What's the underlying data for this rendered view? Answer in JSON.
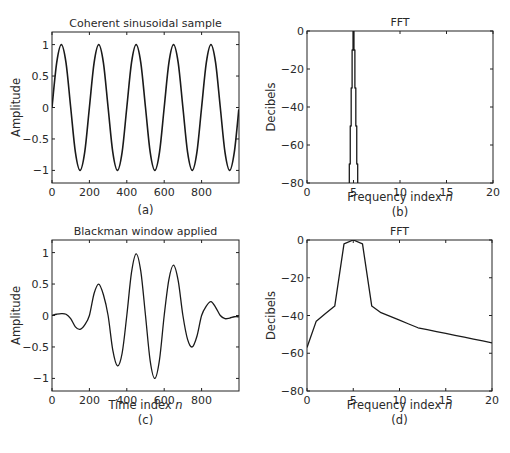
{
  "figure": {
    "panels": [
      {
        "id": "a",
        "title": "Coherent sinusoidal sample",
        "xlabel": "",
        "ylabel": "Amplitude",
        "caption": "(a)"
      },
      {
        "id": "b",
        "title": "FFT",
        "xlabel": "Frequency index n",
        "ylabel": "Decibels",
        "caption": "(b)"
      },
      {
        "id": "c",
        "title": "Blackman window applied",
        "xlabel": "Time index n",
        "ylabel": "Amplitude",
        "caption": "(c)"
      },
      {
        "id": "d",
        "title": "FFT",
        "xlabel": "Frequency index n",
        "ylabel": "Decibels",
        "caption": "(d)"
      }
    ]
  },
  "chart_data": [
    {
      "id": "a",
      "type": "line",
      "title": "Coherent sinusoidal sample",
      "xlabel": "",
      "ylabel": "Amplitude",
      "caption": "(a)",
      "xlim": [
        0,
        1000
      ],
      "ylim": [
        -1.2,
        1.2
      ],
      "xticks": [
        0,
        200,
        400,
        600,
        800
      ],
      "yticks": [
        1,
        0.5,
        0,
        -0.5,
        -1
      ],
      "ytick_labels": [
        "1",
        "0.5",
        "0",
        "−0.5",
        "−1"
      ],
      "grid": false,
      "description": "sin(2*pi*5*n/1000), 5 full cycles",
      "x": [
        0,
        25,
        50,
        75,
        100,
        125,
        150,
        175,
        200,
        225,
        250,
        275,
        300,
        325,
        350,
        375,
        400,
        425,
        450,
        475,
        500,
        525,
        550,
        575,
        600,
        625,
        650,
        675,
        700,
        725,
        750,
        775,
        800,
        825,
        850,
        875,
        900,
        925,
        950,
        975,
        999
      ],
      "values": [
        0,
        0.71,
        1,
        0.71,
        0,
        -0.71,
        -1,
        -0.71,
        0,
        0.71,
        1,
        0.71,
        0,
        -0.71,
        -1,
        -0.71,
        0,
        0.71,
        1,
        0.71,
        0,
        -0.71,
        -1,
        -0.71,
        0,
        0.71,
        1,
        0.71,
        0,
        -0.71,
        -1,
        -0.71,
        0,
        0.71,
        1,
        0.71,
        0,
        -0.71,
        -1,
        -0.71,
        -0.03
      ]
    },
    {
      "id": "b",
      "type": "line",
      "title": "FFT",
      "xlabel": "Frequency index n",
      "ylabel": "Decibels",
      "caption": "(b)",
      "xlim": [
        0,
        20
      ],
      "ylim": [
        -80,
        0
      ],
      "xticks": [
        0,
        5,
        10,
        15,
        20
      ],
      "yticks": [
        0,
        -20,
        -40,
        -60,
        -80
      ],
      "ytick_labels": [
        "0",
        "−20",
        "−40",
        "−60",
        "−80"
      ],
      "grid": false,
      "description": "Single spectral line at n=5 (0 dB); all other bins below -80 dB",
      "x": [
        4.55,
        4.55,
        4.65,
        4.65,
        4.75,
        4.75,
        4.85,
        4.85,
        4.95,
        4.95,
        5.05,
        5.05,
        5.15,
        5.15,
        5.25,
        5.25,
        5.35,
        5.35,
        5.45,
        5.45
      ],
      "values": [
        -80,
        -70,
        -70,
        -50,
        -50,
        -30,
        -30,
        -10,
        -10,
        0,
        0,
        -10,
        -10,
        -30,
        -30,
        -50,
        -50,
        -70,
        -70,
        -80
      ]
    },
    {
      "id": "c",
      "type": "line",
      "title": "Blackman window applied",
      "xlabel": "Time index n",
      "ylabel": "Amplitude",
      "caption": "(c)",
      "xlim": [
        0,
        1000
      ],
      "ylim": [
        -1.2,
        1.2
      ],
      "xticks": [
        0,
        200,
        400,
        600,
        800
      ],
      "yticks": [
        1,
        0.5,
        0,
        -0.5,
        -1
      ],
      "ytick_labels": [
        "1",
        "0.5",
        "0",
        "−0.5",
        "−1"
      ],
      "grid": false,
      "description": "Sinusoid multiplied by Blackman window",
      "x": [
        0,
        25,
        50,
        75,
        100,
        125,
        150,
        175,
        200,
        225,
        250,
        275,
        300,
        325,
        350,
        375,
        400,
        425,
        450,
        475,
        500,
        525,
        550,
        575,
        600,
        625,
        650,
        675,
        700,
        725,
        750,
        775,
        800,
        825,
        850,
        875,
        900,
        925,
        950,
        975,
        999
      ],
      "values": [
        0,
        0.02,
        0.03,
        0.02,
        -0.05,
        -0.18,
        -0.22,
        -0.15,
        0,
        0.35,
        0.5,
        0.33,
        0,
        -0.55,
        -0.8,
        -0.6,
        0,
        0.68,
        0.98,
        0.7,
        0,
        -0.72,
        -1.0,
        -0.7,
        0,
        0.57,
        0.8,
        0.55,
        0,
        -0.38,
        -0.5,
        -0.33,
        0,
        0.15,
        0.22,
        0.13,
        0,
        -0.05,
        -0.04,
        -0.02,
        -0.02
      ]
    },
    {
      "id": "d",
      "type": "line",
      "title": "FFT",
      "xlabel": "Frequency index n",
      "ylabel": "Decibels",
      "caption": "(d)",
      "xlim": [
        0,
        20
      ],
      "ylim": [
        -80,
        0
      ],
      "xticks": [
        0,
        5,
        10,
        15,
        20
      ],
      "yticks": [
        0,
        -20,
        -40,
        -60,
        -80
      ],
      "ytick_labels": [
        "0",
        "−20",
        "−40",
        "−60",
        "−80"
      ],
      "grid": false,
      "description": "Blackman-windowed spectrum: main lobe n=4..6, sidelobes decaying",
      "x": [
        0,
        1,
        2,
        3,
        4,
        5,
        6,
        7,
        8,
        9,
        10,
        11,
        12,
        13,
        14,
        15,
        16,
        17,
        18,
        19,
        20
      ],
      "values": [
        -57,
        -43,
        -39,
        -35,
        -2,
        0,
        -2,
        -35,
        -38.5,
        -40.5,
        -42.5,
        -44.5,
        -46.5,
        -47.5,
        -48.5,
        -49.5,
        -50.5,
        -51.5,
        -52.5,
        -53.5,
        -54.5
      ]
    }
  ]
}
